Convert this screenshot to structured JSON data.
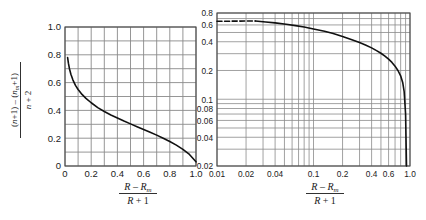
{
  "figure": {
    "background": "#ffffff",
    "grid_color": "#8a8a8a",
    "frame_color": "#4a4a4a",
    "curve_color": "#111111"
  },
  "axis_label": {
    "x_numerator_a": "R",
    "x_minus": "–",
    "x_numerator_b": "R",
    "x_numerator_b_sub": "m",
    "x_denominator_a": "R",
    "x_plus": "+",
    "x_denominator_b": "1",
    "y_numerator": "(n+1) – (n",
    "y_numerator_sub": "m",
    "y_numerator_end": "+1)",
    "y_denominator": "n + 2"
  },
  "chart_data": [
    {
      "id": "left-linear-chart",
      "type": "line",
      "title": "",
      "xlabel": "(R – R_m)/(R + 1)",
      "ylabel": "((n+1) – (n_m+1))/(n + 2)",
      "xscale": "linear",
      "yscale": "linear",
      "xlim": [
        0.0,
        1.0
      ],
      "ylim": [
        0.0,
        1.0
      ],
      "grid": true,
      "legend": "none",
      "xticks": [
        0,
        0.2,
        0.4,
        0.6,
        0.8,
        1.0
      ],
      "xticklabels": [
        "0",
        "0.2",
        "0.4",
        "0.6",
        "0.8",
        "1.0"
      ],
      "xminor": [
        0.1,
        0.3,
        0.5,
        0.7,
        0.9
      ],
      "yticks": [
        0,
        0.2,
        0.4,
        0.6,
        0.8,
        1.0
      ],
      "yticklabels": [
        "0",
        "0.2",
        "0.4",
        "0.6",
        "0.8",
        "1.0"
      ],
      "yminor": [
        0.1,
        0.3,
        0.5,
        0.7,
        0.9
      ],
      "series": [
        {
          "name": "curve",
          "style": "solid",
          "x": [
            0.02,
            0.026,
            0.034,
            0.045,
            0.06,
            0.08,
            0.1,
            0.13,
            0.16,
            0.2,
            0.25,
            0.3,
            0.35,
            0.4,
            0.45,
            0.5,
            0.55,
            0.6,
            0.65,
            0.7,
            0.75,
            0.8,
            0.85,
            0.9,
            0.95,
            1.0
          ],
          "y": [
            0.78,
            0.74,
            0.7,
            0.66,
            0.62,
            0.58,
            0.55,
            0.515,
            0.487,
            0.455,
            0.42,
            0.392,
            0.367,
            0.345,
            0.323,
            0.303,
            0.283,
            0.263,
            0.243,
            0.222,
            0.2,
            0.176,
            0.15,
            0.12,
            0.083,
            0.03
          ]
        }
      ]
    },
    {
      "id": "right-loglog-chart",
      "type": "line",
      "title": "",
      "xlabel": "(R – R_m)/(R + 1)",
      "ylabel": "",
      "xscale": "log",
      "yscale": "log",
      "xlim": [
        0.01,
        1.0
      ],
      "ylim": [
        0.02,
        0.8
      ],
      "grid": true,
      "legend": "none",
      "xticks": [
        0.01,
        0.02,
        0.04,
        0.1,
        0.2,
        0.4,
        0.6,
        1.0
      ],
      "xticklabels": [
        "0.01",
        "0.02",
        "0.04",
        "0.1",
        "0.2",
        "0.4",
        "0.6",
        "1.0"
      ],
      "yticks": [
        0.02,
        0.04,
        0.06,
        0.08,
        0.1,
        0.2,
        0.4,
        0.6,
        0.8
      ],
      "yticklabels": [
        "0.02",
        "0.04",
        "0.06",
        "0.08",
        "0.1",
        "0.2",
        "0.4",
        "0.6",
        "0.8"
      ],
      "series": [
        {
          "name": "extrapolated",
          "style": "dashed",
          "x": [
            0.01,
            0.012,
            0.0145,
            0.0175,
            0.021,
            0.025
          ],
          "y": [
            0.655,
            0.656,
            0.657,
            0.658,
            0.659,
            0.66
          ]
        },
        {
          "name": "curve",
          "style": "solid",
          "x": [
            0.025,
            0.032,
            0.04,
            0.052,
            0.065,
            0.08,
            0.1,
            0.13,
            0.16,
            0.2,
            0.25,
            0.3,
            0.35,
            0.4,
            0.45,
            0.5,
            0.55,
            0.6,
            0.65,
            0.7,
            0.75,
            0.8,
            0.84,
            0.87,
            0.9,
            0.92
          ],
          "y": [
            0.66,
            0.645,
            0.63,
            0.61,
            0.59,
            0.57,
            0.545,
            0.515,
            0.487,
            0.455,
            0.42,
            0.392,
            0.367,
            0.345,
            0.323,
            0.303,
            0.283,
            0.263,
            0.243,
            0.222,
            0.2,
            0.176,
            0.15,
            0.12,
            0.07,
            0.02
          ]
        }
      ]
    }
  ]
}
